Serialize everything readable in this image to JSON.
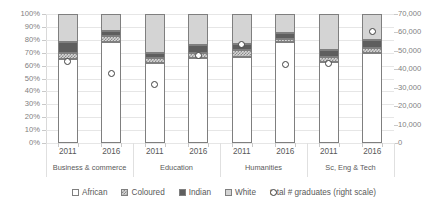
{
  "chart_data": {
    "type": "bar",
    "title": "",
    "subtitle": "",
    "xlabel": "",
    "ylabel": "",
    "y2label": "",
    "grid": true,
    "legend_position": "bottom",
    "stacked": true,
    "stack_mode": "percent",
    "ylim": [
      0,
      100
    ],
    "yticks": [
      "0%",
      "10%",
      "20%",
      "30%",
      "40%",
      "50%",
      "60%",
      "70%",
      "80%",
      "90%",
      "100%"
    ],
    "y2lim": [
      0,
      70000
    ],
    "y2ticks": [
      "0",
      "10,000",
      "20,000",
      "30,000",
      "40,000",
      "50,000",
      "60,000",
      "70,000"
    ],
    "categories": [
      "2011",
      "2016",
      "2011",
      "2016",
      "2011",
      "2016",
      "2011",
      "2016"
    ],
    "groups": [
      {
        "label": "Business & commerce",
        "years": [
          "2011",
          "2016"
        ]
      },
      {
        "label": "Education",
        "years": [
          "2011",
          "2016"
        ]
      },
      {
        "label": "Humanities",
        "years": [
          "2011",
          "2016"
        ]
      },
      {
        "label": "Sc, Eng & Tech",
        "years": [
          "2011",
          "2016"
        ]
      }
    ],
    "series": [
      {
        "name": "African",
        "values": [
          65,
          78,
          62,
          66,
          67,
          78,
          63,
          70
        ]
      },
      {
        "name": "Coloured",
        "values": [
          5,
          5,
          4,
          4,
          5,
          3,
          4,
          4
        ]
      },
      {
        "name": "Indian",
        "values": [
          8,
          4,
          4,
          6,
          5,
          4,
          5,
          6
        ]
      },
      {
        "name": "White",
        "values": [
          22,
          13,
          30,
          24,
          23,
          15,
          28,
          20
        ]
      }
    ],
    "marker_series": {
      "name": "total # graduates (right scale)",
      "axis": "right",
      "values": [
        44000,
        37500,
        31500,
        47500,
        53500,
        42500,
        43000,
        60500
      ]
    },
    "legend": [
      {
        "label": "African",
        "swatch": "african"
      },
      {
        "label": "Coloured",
        "swatch": "coloured"
      },
      {
        "label": "Indian",
        "swatch": "indian"
      },
      {
        "label": "White",
        "swatch": "white"
      },
      {
        "label": "total # graduates (right scale)",
        "swatch": "marker"
      }
    ],
    "colors": {
      "african": "#ffffff",
      "coloured": "#d6d6d6",
      "indian": "#5e5e5e",
      "white": "#d4d4d4",
      "marker": "#3f3f3f",
      "grid": "#e6e6e6",
      "text": "#595959"
    }
  }
}
